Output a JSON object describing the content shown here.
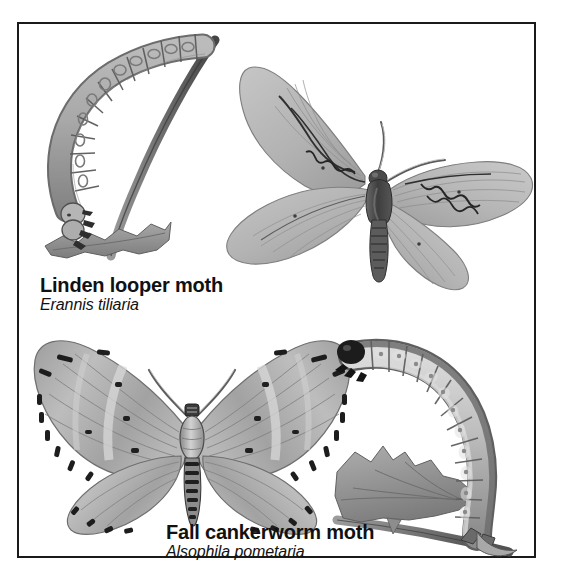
{
  "plate": {
    "background_color": "#ffffff",
    "border_color": "#1a1a1a",
    "ink_color": "#111111"
  },
  "specimens": [
    {
      "id": "linden-looper",
      "common_name": "Linden looper moth",
      "scientific_name": "Erannis tiliaria",
      "parts": [
        "larva on twig with chewed leaf",
        "adult moth with wings spread"
      ],
      "palette": {
        "wing": "#b4b4b4",
        "wing_light": "#c9c9c9",
        "wing_dark": "#8e8e8e",
        "body": "#4a4a4a",
        "markings": "#2b2b2b",
        "twig": "#7b7b7b",
        "leaf": "#9a9a9a"
      }
    },
    {
      "id": "fall-cankerworm",
      "common_name": "Fall cankerworm moth",
      "scientific_name": "Alsophila pometaria",
      "parts": [
        "adult moth with wings spread",
        "larva on twig with chewed leaf"
      ],
      "palette": {
        "wing": "#a9a9a9",
        "wing_light": "#c6c6c6",
        "wing_dark": "#808080",
        "body": "#565656",
        "markings": "#1f1f1f",
        "twig": "#7b7b7b",
        "leaf": "#9a9a9a"
      }
    }
  ]
}
